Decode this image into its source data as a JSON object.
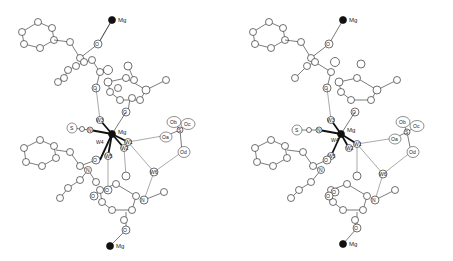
{
  "figure": {
    "type": "stereo-pair",
    "panels": [
      "left",
      "right"
    ],
    "labels": {
      "mg_top": "Mg",
      "mg_center": "Mg",
      "mg_bottom": "Mg",
      "s_scn": "S",
      "w1": "W1",
      "w2": "W2",
      "w3": "W3",
      "w4": "W4",
      "w5": "W5",
      "w6": "W6",
      "o_top": "O",
      "o_mid1": "O",
      "o_mid2": "O",
      "o_low1": "O",
      "o_low2": "O",
      "o_low3": "O",
      "o_bottom": "O",
      "sulfate_s": "S",
      "sulfate_oa": "Oa",
      "sulfate_ob": "Ob",
      "sulfate_oc": "Oc",
      "sulfate_od": "Od",
      "n_upper": "N",
      "n_lower": "N",
      "n_scn": "N"
    }
  }
}
